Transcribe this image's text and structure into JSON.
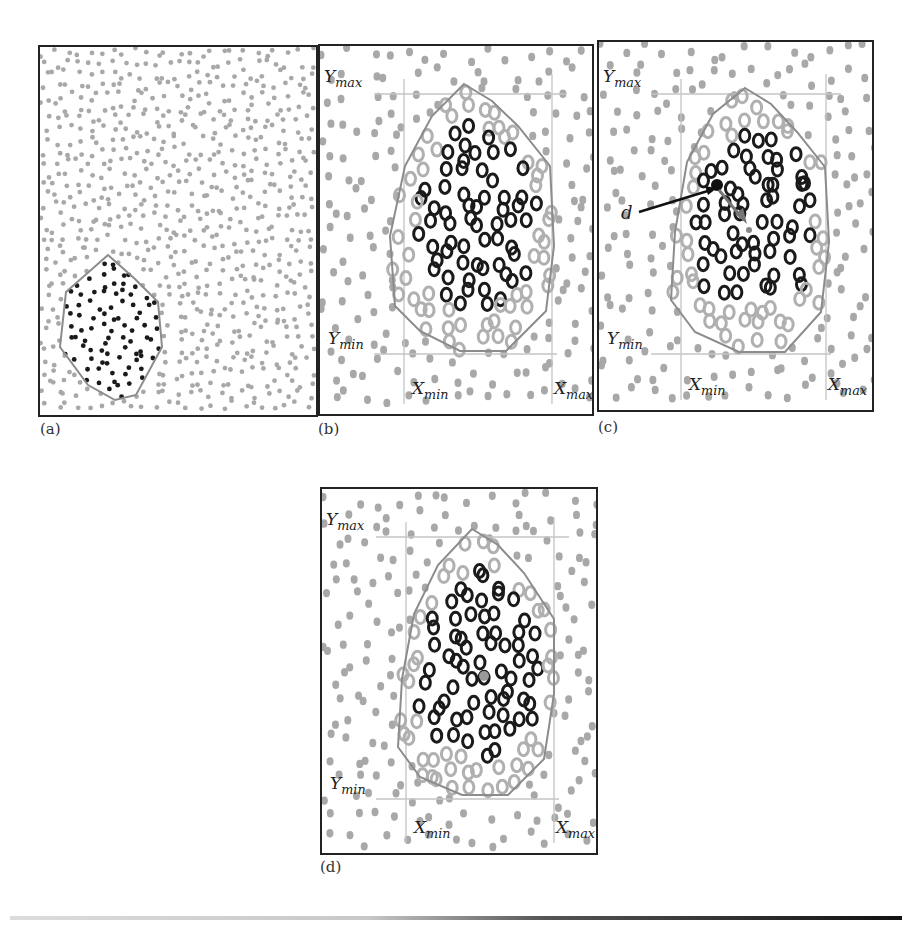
{
  "figure": {
    "panels": [
      {
        "id": "a",
        "caption": "(a)",
        "frame": {
          "x": 38,
          "y": 45,
          "w": 280,
          "h": 372
        }
      },
      {
        "id": "b",
        "caption": "(b)",
        "frame": {
          "x": 318,
          "y": 44,
          "w": 276,
          "h": 372
        }
      },
      {
        "id": "c",
        "caption": "(c)",
        "frame": {
          "x": 597,
          "y": 40,
          "w": 277,
          "h": 372
        }
      },
      {
        "id": "d",
        "caption": "(d)",
        "frame": {
          "x": 320,
          "y": 487,
          "w": 278,
          "h": 368
        }
      }
    ],
    "labels": {
      "y_max": "Y",
      "y_max_sub": "max",
      "y_min": "Y",
      "y_min_sub": "min",
      "x_min": "X",
      "x_min_sub": "min",
      "x_max": "X",
      "x_max_sub": "max",
      "d": "d"
    },
    "colors": {
      "background_dot": "#a8a8a8",
      "region_dot": "#1a1a1a",
      "hull": "#8c8c8c",
      "bbox_line": "#c4c4c4",
      "frame": "#222222"
    }
  }
}
